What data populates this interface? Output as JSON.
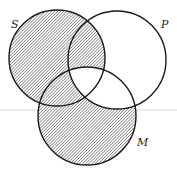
{
  "diagram": {
    "type": "venn",
    "sets": [
      {
        "name": "S",
        "cx": 57,
        "cy": 58,
        "r": 48,
        "label_x": 11,
        "label_y": 28
      },
      {
        "name": "P",
        "cx": 117,
        "cy": 60,
        "r": 49,
        "label_x": 161,
        "label_y": 28
      },
      {
        "name": "M",
        "cx": 87,
        "cy": 116,
        "r": 49,
        "label_x": 137,
        "label_y": 146
      }
    ],
    "shaded_regions": [
      "S only",
      "S∩P (not M)",
      "S∩M (not P)",
      "M only"
    ],
    "unshaded_regions": [
      "P only",
      "P∩M (not S)",
      "S∩P∩M"
    ],
    "colors": {
      "stroke": "#1a1a1a",
      "hatch": "#555555",
      "background": "#ffffff",
      "guide_line": "#d8d8d8"
    },
    "guide_line_y": 110
  }
}
